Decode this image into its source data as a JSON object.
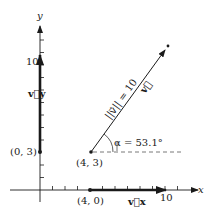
{
  "figure": {
    "axes": {
      "x_label": "x",
      "y_label": "y",
      "x_tick_label": "10",
      "y_tick_label": "10",
      "unit_px": 12.5,
      "origin_px": [
        40,
        190
      ]
    },
    "points": {
      "start": "(4, 3)",
      "x_projection": "(4, 0)",
      "y_projection": "(0, 3)"
    },
    "vectors": {
      "main": {
        "label": "v⃗",
        "from": [
          4,
          3
        ],
        "to": [
          10.2,
          11.5
        ]
      },
      "x_component": {
        "label": "v⃗x",
        "from": [
          4,
          0
        ],
        "to": [
          10,
          0
        ]
      },
      "y_component": {
        "label": "v⃗y",
        "from": [
          0,
          3
        ],
        "to": [
          0,
          10.6
        ]
      }
    },
    "annotations": {
      "magnitude": "||v⃗|| = 10",
      "angle": "α = 53.1°",
      "angle_symbol": "α",
      "angle_value": "53.1°",
      "magnitude_value": "10"
    },
    "colors": {
      "ink": "#1a1a1a",
      "dash": "#555555"
    }
  }
}
